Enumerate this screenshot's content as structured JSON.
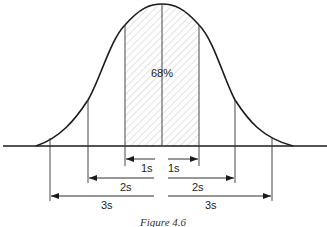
{
  "figure": {
    "caption": "Figure 4.6",
    "center_label": "68%",
    "hatched_region": "mean ± 1s",
    "colors": {
      "ink": "#1a1a1a",
      "hatch": "#b0b0b0",
      "background": "#ffffff"
    }
  },
  "intervals": [
    {
      "id": "1s",
      "left_label": "1s",
      "right_label": "1s"
    },
    {
      "id": "2s",
      "left_label": "2s",
      "right_label": "2s"
    },
    {
      "id": "3s",
      "left_label": "3s",
      "right_label": "3s"
    }
  ]
}
